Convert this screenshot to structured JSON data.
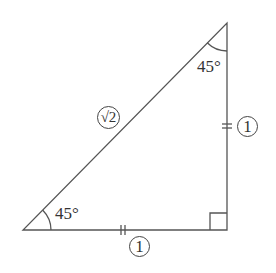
{
  "diagram": {
    "type": "right isosceles triangle (45-45-90)",
    "colors": {
      "stroke": "#555555",
      "text": "#333333",
      "background": "#ffffff"
    },
    "vertices": {
      "bottom_left": [
        23,
        230
      ],
      "bottom_right_right_angle": [
        227,
        230
      ],
      "top": [
        227,
        23
      ]
    },
    "angles": {
      "bottom_left": "45°",
      "top": "45°",
      "bottom_right": "right angle"
    },
    "sides": {
      "hypotenuse": {
        "label": "√2",
        "circled": true
      },
      "vertical_leg": {
        "label": "1",
        "circled": true,
        "tick_marks": 2
      },
      "horizontal_leg": {
        "label": "1",
        "circled": true,
        "tick_marks": 2
      }
    }
  }
}
